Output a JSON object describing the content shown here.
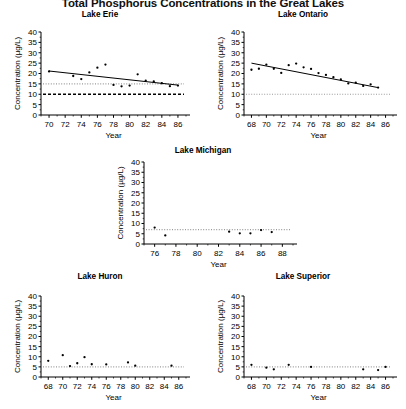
{
  "figure": {
    "title": "Total Phosphorus Concentrations in the Great Lakes",
    "axis": {
      "ylabel": "Concentration (µg/L)",
      "xlabel": "Year",
      "yticks": [
        0,
        5,
        10,
        15,
        20,
        25,
        30,
        35,
        40
      ]
    }
  },
  "chart_data": [
    {
      "type": "scatter",
      "title": "Lake Erie",
      "xlabel": "Year",
      "ylabel": "Concentration (µg/L)",
      "xlim": [
        69,
        87
      ],
      "ylim": [
        0,
        40
      ],
      "xticks": [
        70,
        72,
        74,
        76,
        78,
        80,
        82,
        84,
        86
      ],
      "yticks": [
        0,
        5,
        10,
        15,
        20,
        25,
        30,
        35,
        40
      ],
      "grid": false,
      "legend": "none",
      "points": [
        {
          "x": 70,
          "y": 21.0
        },
        {
          "x": 73,
          "y": 18.8
        },
        {
          "x": 74,
          "y": 17.3
        },
        {
          "x": 75,
          "y": 20.5
        },
        {
          "x": 76,
          "y": 22.8
        },
        {
          "x": 77,
          "y": 24.3
        },
        {
          "x": 78,
          "y": 14.5
        },
        {
          "x": 79,
          "y": 13.8
        },
        {
          "x": 80,
          "y": 14.2
        },
        {
          "x": 81,
          "y": 19.6
        },
        {
          "x": 82,
          "y": 16.5
        },
        {
          "x": 83,
          "y": 16.2
        },
        {
          "x": 84,
          "y": 15.3
        },
        {
          "x": 85,
          "y": 13.9
        },
        {
          "x": 86,
          "y": 14.2
        }
      ],
      "trend_line": {
        "x": [
          70,
          86
        ],
        "y": [
          21.2,
          14.4
        ],
        "style": "solid"
      },
      "reference_lines": [
        {
          "y": 15,
          "style": "dotted",
          "color": "#9a9a9a"
        },
        {
          "y": 10,
          "style": "dashed",
          "color": "#000000"
        }
      ]
    },
    {
      "type": "scatter",
      "title": "Lake Ontario",
      "xlabel": "Year",
      "ylabel": "Concentration (µg/L)",
      "xlim": [
        67,
        87
      ],
      "ylim": [
        0,
        40
      ],
      "xticks": [
        68,
        70,
        72,
        74,
        76,
        78,
        80,
        82,
        84,
        86
      ],
      "yticks": [
        0,
        5,
        10,
        15,
        20,
        25,
        30,
        35,
        40
      ],
      "grid": false,
      "legend": "none",
      "points": [
        {
          "x": 68,
          "y": 21.8
        },
        {
          "x": 69,
          "y": 22.3
        },
        {
          "x": 70,
          "y": 24.3
        },
        {
          "x": 71,
          "y": 22.3
        },
        {
          "x": 72,
          "y": 20.3
        },
        {
          "x": 73,
          "y": 24.0
        },
        {
          "x": 74,
          "y": 24.8
        },
        {
          "x": 75,
          "y": 23.0
        },
        {
          "x": 76,
          "y": 22.2
        },
        {
          "x": 77,
          "y": 20.2
        },
        {
          "x": 78,
          "y": 19.3
        },
        {
          "x": 79,
          "y": 18.2
        },
        {
          "x": 80,
          "y": 17.2
        },
        {
          "x": 81,
          "y": 15.2
        },
        {
          "x": 82,
          "y": 15.6
        },
        {
          "x": 83,
          "y": 14.0
        },
        {
          "x": 84,
          "y": 14.8
        },
        {
          "x": 85,
          "y": 13.2
        }
      ],
      "trend_line": {
        "x": [
          68,
          85
        ],
        "y": [
          25.0,
          13.2
        ],
        "style": "solid"
      },
      "reference_lines": [
        {
          "y": 10,
          "style": "dotted",
          "color": "#9a9a9a"
        }
      ]
    },
    {
      "type": "scatter",
      "title": "Lake Michigan",
      "xlabel": "Year",
      "ylabel": "Concentration (µg/L)",
      "xlim": [
        75,
        89
      ],
      "ylim": [
        0,
        40
      ],
      "xticks": [
        76,
        78,
        80,
        82,
        84,
        86,
        88
      ],
      "yticks": [
        0,
        5,
        10,
        15,
        20,
        25,
        30,
        35,
        40
      ],
      "grid": false,
      "legend": "none",
      "points": [
        {
          "x": 76,
          "y": 8.0
        },
        {
          "x": 77,
          "y": 4.2
        },
        {
          "x": 83,
          "y": 6.0
        },
        {
          "x": 84,
          "y": 5.2
        },
        {
          "x": 85,
          "y": 5.2
        },
        {
          "x": 86,
          "y": 6.8
        },
        {
          "x": 87,
          "y": 5.8
        }
      ],
      "trend_line": null,
      "reference_lines": [
        {
          "y": 7,
          "style": "dotted",
          "color": "#9a9a9a"
        }
      ]
    },
    {
      "type": "scatter",
      "title": "Lake Huron",
      "xlabel": "Year",
      "ylabel": "Concentration (µg/L)",
      "xlim": [
        67,
        87
      ],
      "ylim": [
        0,
        40
      ],
      "xticks": [
        68,
        70,
        72,
        74,
        76,
        78,
        80,
        82,
        84,
        86
      ],
      "yticks": [
        0,
        5,
        10,
        15,
        20,
        25,
        30,
        35,
        40
      ],
      "grid": false,
      "legend": "none",
      "points": [
        {
          "x": 68,
          "y": 8.0
        },
        {
          "x": 70,
          "y": 10.8
        },
        {
          "x": 71,
          "y": 5.4
        },
        {
          "x": 72,
          "y": 6.8
        },
        {
          "x": 73,
          "y": 9.8
        },
        {
          "x": 74,
          "y": 6.3
        },
        {
          "x": 76,
          "y": 6.2
        },
        {
          "x": 79,
          "y": 7.2
        },
        {
          "x": 80,
          "y": 5.6
        },
        {
          "x": 85,
          "y": 5.6
        }
      ],
      "trend_line": null,
      "reference_lines": [
        {
          "y": 5,
          "style": "dotted",
          "color": "#9a9a9a"
        }
      ]
    },
    {
      "type": "scatter",
      "title": "Lake Superior",
      "xlabel": "Year",
      "ylabel": "Concentration (µg/L)",
      "xlim": [
        67,
        87
      ],
      "ylim": [
        0,
        40
      ],
      "xticks": [
        68,
        70,
        72,
        74,
        76,
        78,
        80,
        82,
        84,
        86
      ],
      "yticks": [
        0,
        5,
        10,
        15,
        20,
        25,
        30,
        35,
        40
      ],
      "grid": false,
      "legend": "none",
      "points": [
        {
          "x": 68,
          "y": 6.0
        },
        {
          "x": 70,
          "y": 4.6
        },
        {
          "x": 71,
          "y": 3.8
        },
        {
          "x": 73,
          "y": 6.0
        },
        {
          "x": 76,
          "y": 5.0
        },
        {
          "x": 83,
          "y": 3.8
        },
        {
          "x": 85,
          "y": 3.4
        },
        {
          "x": 86,
          "y": 5.0
        }
      ],
      "trend_line": null,
      "reference_lines": [
        {
          "y": 5,
          "style": "dotted",
          "color": "#9a9a9a"
        }
      ]
    }
  ]
}
